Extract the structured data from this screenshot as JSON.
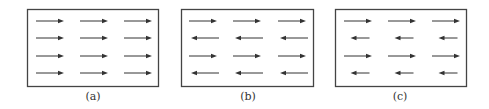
{
  "figure": {
    "stroke_color": "#444444",
    "arrow_color": "#333333",
    "panels": [
      {
        "id": "a",
        "label": "(a)",
        "description": "all arrows point right, equal length",
        "box": {
          "x": 27,
          "y": 9,
          "w": 131,
          "h": 77
        },
        "label_x": 73,
        "rows": [
          {
            "y": 21,
            "direction": "right",
            "length": 28
          },
          {
            "y": 38,
            "direction": "right",
            "length": 28
          },
          {
            "y": 56,
            "direction": "right",
            "length": 28
          },
          {
            "y": 73,
            "direction": "right",
            "length": 28
          }
        ],
        "cols_x": [
          36,
          80,
          124
        ]
      },
      {
        "id": "b",
        "label": "(b)",
        "description": "alternating rows right/left, equal length",
        "box": {
          "x": 181,
          "y": 9,
          "w": 132,
          "h": 77
        },
        "label_x": 228,
        "rows": [
          {
            "y": 21,
            "direction": "right",
            "length": 28
          },
          {
            "y": 38,
            "direction": "left",
            "length": 28
          },
          {
            "y": 56,
            "direction": "right",
            "length": 28
          },
          {
            "y": 73,
            "direction": "left",
            "length": 28
          }
        ],
        "cols_x": [
          189,
          233,
          278
        ]
      },
      {
        "id": "c",
        "label": "(c)",
        "description": "alternating rows right/left, left arrows shorter",
        "box": {
          "x": 335,
          "y": 9,
          "w": 131,
          "h": 77
        },
        "label_x": 380,
        "rows": [
          {
            "y": 21,
            "direction": "right",
            "length": 28
          },
          {
            "y": 38,
            "direction": "left",
            "length": 19
          },
          {
            "y": 56,
            "direction": "right",
            "length": 28
          },
          {
            "y": 73,
            "direction": "left",
            "length": 19
          }
        ],
        "cols_x": [
          344,
          388,
          432
        ]
      }
    ]
  }
}
